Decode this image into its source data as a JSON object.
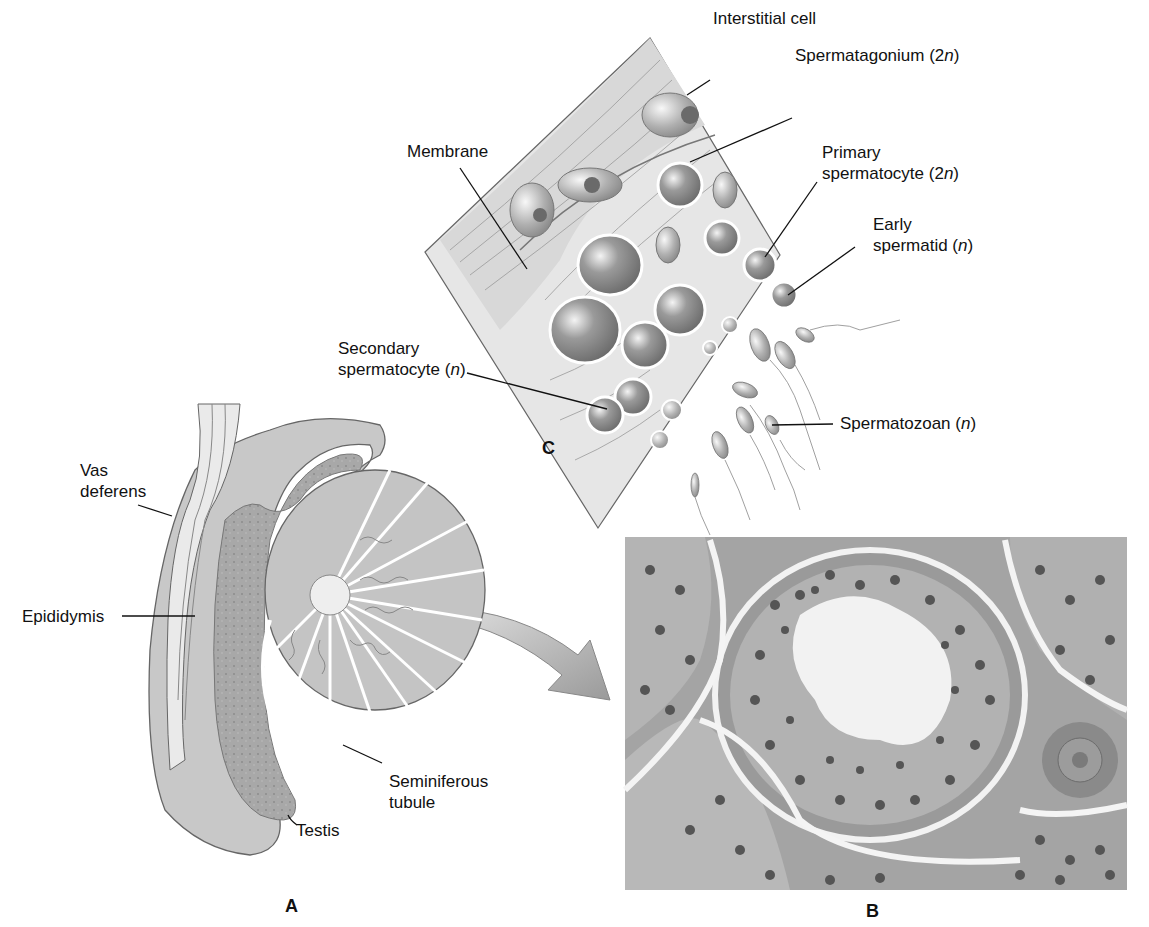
{
  "figure": {
    "panels": {
      "A": {
        "letter": "A",
        "description": "Sagittal section of testis and epididymis"
      },
      "B": {
        "letter": "B",
        "description": "Micrograph cross-section of seminiferous tubule"
      },
      "C": {
        "letter": "C",
        "description": "Detail of seminiferous tubule wall showing spermatogenesis"
      }
    },
    "labels_c": {
      "interstitial_cell": "Interstitial cell",
      "spermatagonium": "Spermatagonium (2",
      "spermatagonium_n": "n",
      "spermatagonium_end": ")",
      "membrane": "Membrane",
      "primary_1": "Primary",
      "primary_2": "spermatocyte (2",
      "primary_n": "n",
      "primary_end": ")",
      "early_1": "Early",
      "early_2": "spermatid (",
      "early_n": "n",
      "early_end": ")",
      "secondary_1": "Secondary",
      "secondary_2": "spermatocyte (",
      "secondary_n": "n",
      "secondary_end": ")",
      "spermatozoan": "Spermatozoan (",
      "spermatozoan_n": "n",
      "spermatozoan_end": ")"
    },
    "labels_a": {
      "vas_1": "Vas",
      "vas_2": "deferens",
      "epididymis": "Epididymis",
      "seminiferous_1": "Seminiferous",
      "seminiferous_2": "tubule",
      "testis": "Testis"
    }
  }
}
